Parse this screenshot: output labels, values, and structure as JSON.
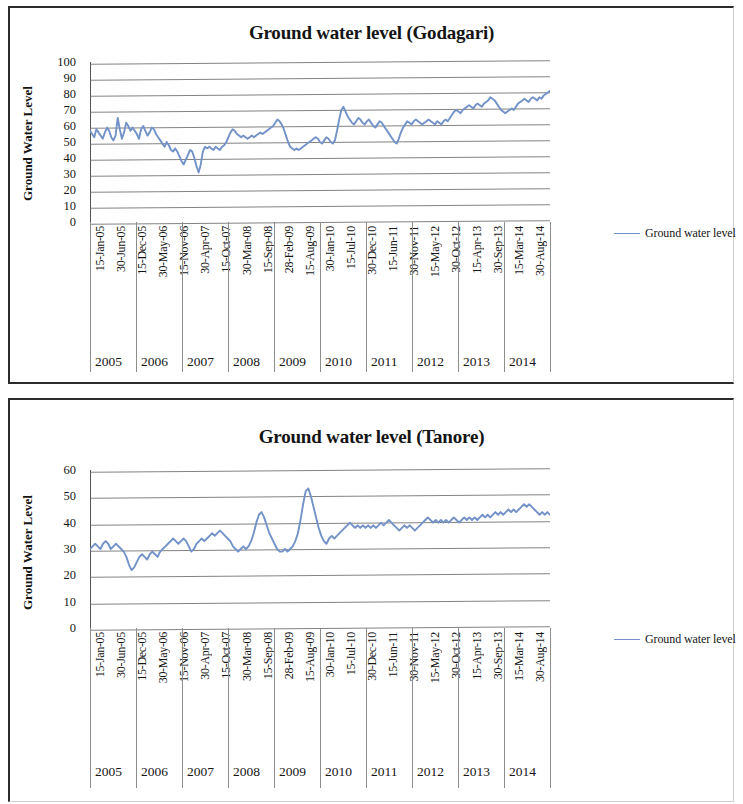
{
  "document": {
    "kind": "scanned-figure-page",
    "charts_count": 2
  },
  "charts": [
    {
      "id": "godagari",
      "title": "Ground water level (Godagari)",
      "ylabel": "Ground Water Level",
      "legend_label": "Ground water level",
      "line_color": "#7392c8",
      "grid_color": "#6d6d6d"
    },
    {
      "id": "tanore",
      "title": "Ground water level (Tanore)",
      "ylabel": "Ground Water Level",
      "legend_label": "Ground water level",
      "line_color": "#7392c8",
      "grid_color": "#6d6d6d"
    }
  ],
  "chart_data": [
    {
      "type": "line",
      "id": "godagari",
      "title": "Ground water level (Godagari)",
      "xlabel": "",
      "ylabel": "Ground Water Level",
      "ylim": [
        0,
        100
      ],
      "yticks": [
        0,
        10,
        20,
        30,
        40,
        50,
        60,
        70,
        80,
        90,
        100
      ],
      "grid": true,
      "legend": [
        "Ground water level"
      ],
      "legend_position": "right",
      "tick_labels": [
        "15-Jan-05",
        "30-Jun-05",
        "15-Dec-05",
        "30-May-06",
        "15-Nov-06",
        "30-Apr-07",
        "15-Oct-07",
        "30-Mar-08",
        "15-Sep-08",
        "28-Feb-09",
        "15-Aug-09",
        "30-Jan-10",
        "15-Jul-10",
        "30-Dec-10",
        "15-Jun-11",
        "30-Nov-11",
        "15-May-12",
        "30-Oct-12",
        "15-Apr-13",
        "30-Sep-13",
        "15-Mar-14",
        "30-Aug-14"
      ],
      "group_labels": [
        "2005",
        "2006",
        "2007",
        "2008",
        "2009",
        "2010",
        "2011",
        "2012",
        "2013",
        "2014"
      ],
      "series": [
        {
          "name": "Ground water level",
          "color": "#7392c8",
          "values": [
            57,
            55,
            53,
            58,
            56,
            54,
            52,
            56,
            59,
            57,
            53,
            51,
            54,
            65,
            58,
            52,
            56,
            62,
            60,
            57,
            59,
            57,
            55,
            52,
            58,
            60,
            57,
            54,
            56,
            59,
            58,
            55,
            53,
            51,
            49,
            47,
            50,
            48,
            45,
            44,
            46,
            44,
            41,
            38,
            36,
            39,
            42,
            45,
            44,
            40,
            35,
            31,
            36,
            44,
            47,
            46,
            47,
            46,
            45,
            47,
            46,
            45,
            47,
            48,
            50,
            53,
            56,
            58,
            57,
            55,
            54,
            53,
            54,
            53,
            52,
            53,
            54,
            53,
            54,
            55,
            56,
            55,
            56,
            57,
            58,
            59,
            60,
            62,
            64,
            63,
            61,
            58,
            54,
            50,
            47,
            46,
            45,
            46,
            45,
            46,
            47,
            48,
            49,
            50,
            51,
            52,
            53,
            52,
            50,
            49,
            51,
            53,
            52,
            50,
            49,
            51,
            57,
            64,
            70,
            72,
            69,
            66,
            64,
            62,
            61,
            63,
            65,
            64,
            62,
            61,
            63,
            64,
            62,
            60,
            59,
            61,
            63,
            62,
            60,
            58,
            56,
            54,
            52,
            50,
            49,
            52,
            56,
            59,
            61,
            63,
            62,
            61,
            63,
            64,
            63,
            62,
            61,
            62,
            63,
            64,
            63,
            62,
            61,
            63,
            62,
            61,
            63,
            64,
            63,
            65,
            67,
            69,
            70,
            69,
            68,
            70,
            71,
            72,
            73,
            72,
            71,
            73,
            74,
            73,
            72,
            74,
            75,
            76,
            78,
            77,
            76,
            74,
            72,
            70,
            69,
            68,
            69,
            70,
            71,
            70,
            72,
            74,
            75,
            76,
            77,
            76,
            75,
            77,
            78,
            77,
            76,
            78,
            77,
            79,
            80,
            81,
            82
          ]
        }
      ]
    },
    {
      "type": "line",
      "id": "tanore",
      "title": "Ground water level (Tanore)",
      "xlabel": "",
      "ylabel": "Ground Water Level",
      "ylim": [
        0,
        60
      ],
      "yticks": [
        0,
        10,
        20,
        30,
        40,
        50,
        60
      ],
      "grid": true,
      "legend": [
        "Ground water level"
      ],
      "legend_position": "right",
      "tick_labels": [
        "15-Jan-05",
        "30-Jun-05",
        "15-Dec-05",
        "30-May-06",
        "15-Nov-06",
        "30-Apr-07",
        "15-Oct-07",
        "30-Mar-08",
        "15-Sep-08",
        "28-Feb-09",
        "15-Aug-09",
        "30-Jan-10",
        "15-Jul-10",
        "30-Dec-10",
        "15-Jun-11",
        "30-Nov-11",
        "15-May-12",
        "30-Oct-12",
        "15-Apr-13",
        "30-Sep-13",
        "15-Mar-14",
        "30-Aug-14"
      ],
      "group_labels": [
        "2005",
        "2006",
        "2007",
        "2008",
        "2009",
        "2010",
        "2011",
        "2012",
        "2013",
        "2014"
      ],
      "series": [
        {
          "name": "Ground water level",
          "color": "#7392c8",
          "values": [
            30,
            31,
            32,
            31,
            30,
            32,
            33,
            32,
            30,
            31,
            32,
            31,
            30,
            29,
            27,
            24,
            22,
            23,
            25,
            27,
            28,
            27,
            26,
            28,
            29,
            28,
            27,
            29,
            30,
            31,
            32,
            33,
            34,
            33,
            32,
            33,
            34,
            33,
            31,
            29,
            30,
            32,
            33,
            34,
            33,
            34,
            35,
            36,
            35,
            36,
            37,
            36,
            35,
            34,
            33,
            31,
            30,
            29,
            30,
            31,
            30,
            31,
            33,
            36,
            40,
            43,
            44,
            42,
            39,
            36,
            34,
            32,
            30,
            29,
            29,
            30,
            29,
            30,
            31,
            33,
            36,
            41,
            47,
            52,
            53,
            50,
            46,
            42,
            38,
            35,
            33,
            32,
            34,
            35,
            34,
            35,
            36,
            37,
            38,
            39,
            40,
            39,
            38,
            39,
            38,
            39,
            38,
            39,
            38,
            39,
            38,
            39,
            40,
            39,
            40,
            41,
            40,
            39,
            38,
            37,
            38,
            39,
            38,
            39,
            38,
            37,
            38,
            39,
            40,
            41,
            42,
            41,
            40,
            41,
            40,
            41,
            40,
            41,
            40,
            41,
            42,
            41,
            40,
            41,
            42,
            41,
            42,
            41,
            42,
            41,
            42,
            43,
            42,
            43,
            42,
            43,
            44,
            43,
            44,
            43,
            44,
            45,
            44,
            45,
            44,
            45,
            46,
            47,
            46,
            47,
            46,
            45,
            44,
            43,
            44,
            43,
            44,
            43
          ]
        }
      ]
    }
  ]
}
